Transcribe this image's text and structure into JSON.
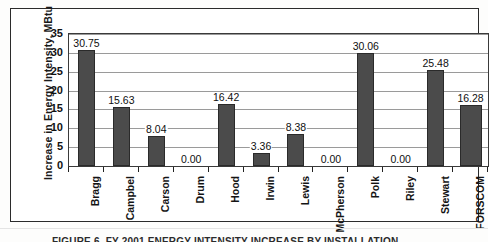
{
  "chart_data": {
    "type": "bar",
    "title": "",
    "xlabel": "",
    "ylabel": "Increase in Energy Intensity, MBtu",
    "ylim": [
      0,
      35
    ],
    "ytick_step": 5,
    "yticks": [
      "0",
      "5",
      "10",
      "15",
      "20",
      "25",
      "30",
      "35"
    ],
    "grid": true,
    "legend": "none",
    "categories": [
      "Bragg",
      "Campbel",
      "Carson",
      "Drum",
      "Hood",
      "Irwin",
      "Lewis",
      "McPherson",
      "Polk",
      "Riley",
      "Stewart",
      "FORSCOM"
    ],
    "values": [
      30.75,
      15.63,
      8.04,
      0.0,
      16.42,
      3.36,
      8.38,
      0.0,
      30.06,
      0.0,
      25.48,
      16.28
    ],
    "data_labels": [
      "30.75",
      "15.63",
      "8.04",
      "0.00",
      "16.42",
      "3.36",
      "8.38",
      "0.00",
      "30.06",
      "0.00",
      "25.48",
      "16.28"
    ],
    "bar_color": "#4b4b4b",
    "plot_border_color": "#3a3a3a",
    "gridline_color": "#9a9a9a"
  },
  "figure": {
    "caption": "FIGURE 6. FY 2001 ENERGY INTENSITY INCREASE BY INSTALLATION"
  },
  "colors": {
    "page_background": "#fdfdfc",
    "frame_border": "#2b2b2b",
    "text": "#111111"
  }
}
